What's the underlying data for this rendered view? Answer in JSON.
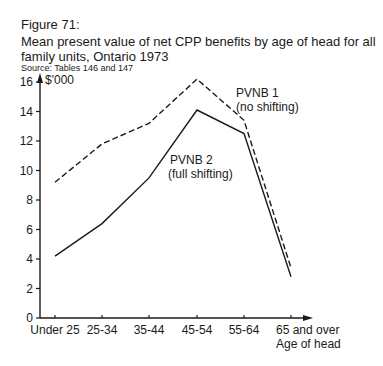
{
  "figure": {
    "label": "Figure 71:",
    "title": "Mean present value of net CPP benefits by age of head for all family units, Ontario 1973",
    "source": "Source: Tables 146 and 147"
  },
  "chart_data": {
    "type": "line",
    "title": "Mean present value of net CPP benefits by age of head for all family units, Ontario 1973",
    "xlabel": "Age of head",
    "ylabel": "$'000",
    "categories": [
      "Under 25",
      "25-34",
      "35-44",
      "45-54",
      "55-64",
      "65 and over"
    ],
    "yticks": [
      0,
      2,
      4,
      6,
      8,
      10,
      12,
      14,
      16
    ],
    "ylim": [
      0,
      16
    ],
    "grid": false,
    "legend": "inline annotations",
    "series": [
      {
        "name": "PVNB 1 (no shifting)",
        "style": "dashed",
        "values": [
          9.2,
          11.8,
          13.2,
          16.2,
          13.4,
          3.4
        ]
      },
      {
        "name": "PVNB 2 (full shifting)",
        "style": "solid",
        "values": [
          4.2,
          6.4,
          9.5,
          14.1,
          12.5,
          2.8
        ]
      }
    ],
    "annotations": [
      {
        "line1": "PVNB 1",
        "line2": "(no shifting)"
      },
      {
        "line1": "PVNB 2",
        "line2": "(full shifting)"
      }
    ]
  }
}
